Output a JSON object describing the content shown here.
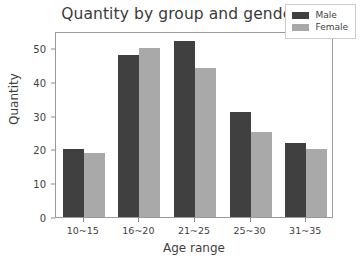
{
  "chart_data": {
    "type": "bar",
    "title": "Quantity by group and gender",
    "xlabel": "Age range",
    "ylabel": "Quantity",
    "categories": [
      "10~15",
      "16~20",
      "21~25",
      "25~30",
      "31~35"
    ],
    "series": [
      {
        "name": "Male",
        "color": "#404040",
        "values": [
          20,
          48,
          52,
          31,
          22
        ]
      },
      {
        "name": "Female",
        "color": "#a9a9a9",
        "values": [
          19,
          50,
          44,
          25,
          20
        ]
      }
    ],
    "ylim": [
      0,
      55
    ],
    "yticks": [
      0,
      10,
      20,
      30,
      40,
      50
    ],
    "ytick_labels": [
      "0",
      "10",
      "20",
      "30",
      "40",
      "50"
    ],
    "grid": false,
    "legend_position": "upper right",
    "background": "#ffffff",
    "axes_edge_color": "#9a9a9a"
  }
}
